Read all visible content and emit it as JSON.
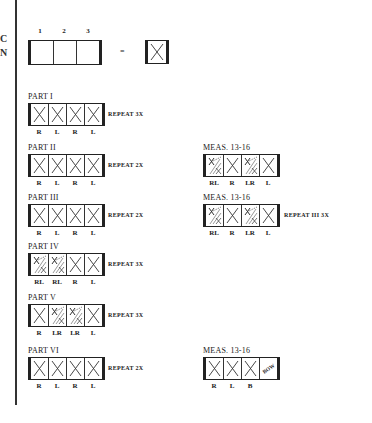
{
  "margin_letters": [
    "C",
    "N"
  ],
  "legend": {
    "numbers": [
      "1",
      "2",
      "3"
    ],
    "equals": "=",
    "cells": [
      "x",
      "",
      ""
    ],
    "single_cell": "x"
  },
  "parts": [
    {
      "label": "PART I",
      "cells": [
        "x",
        "x",
        "x",
        "x"
      ],
      "feet": [
        "R",
        "L",
        "R",
        "L"
      ],
      "repeat": "REPEAT 3X"
    },
    {
      "label": "PART II",
      "cells": [
        "x",
        "x",
        "x",
        "x"
      ],
      "feet": [
        "R",
        "L",
        "R",
        "L"
      ],
      "repeat": "REPEAT 2X"
    },
    {
      "label": "PART III",
      "cells": [
        "x",
        "x",
        "x",
        "x"
      ],
      "feet": [
        "R",
        "L",
        "R",
        "L"
      ],
      "repeat": "REPEAT 2X"
    },
    {
      "label": "PART IV",
      "cells": [
        "hatch",
        "hatch",
        "x",
        "x"
      ],
      "feet": [
        "RL",
        "RL",
        "R",
        "L"
      ],
      "repeat": "REPEAT 3X"
    },
    {
      "label": "PART V",
      "cells": [
        "x",
        "hatch",
        "hatch",
        "x"
      ],
      "feet": [
        "R",
        "LR",
        "LR",
        "L"
      ],
      "repeat": "REPEAT 3X"
    },
    {
      "label": "PART VI",
      "cells": [
        "x",
        "x",
        "x",
        "x"
      ],
      "feet": [
        "R",
        "L",
        "R",
        "L"
      ],
      "repeat": "REPEAT 2X"
    }
  ],
  "measures": [
    {
      "label": "MEAS. 13-16",
      "cells": [
        "hatch",
        "x",
        "hatch",
        "x"
      ],
      "feet": [
        "RL",
        "R",
        "LR",
        "L"
      ],
      "repeat": ""
    },
    {
      "label": "MEAS. 13-16",
      "cells": [
        "hatch",
        "x",
        "hatch",
        "x"
      ],
      "feet": [
        "RL",
        "R",
        "LR",
        "L"
      ],
      "repeat": "REPEAT III 3X"
    },
    {
      "label": "MEAS. 13-16",
      "cells": [
        "x",
        "x",
        "x",
        "bow"
      ],
      "feet": [
        "R",
        "L",
        "B",
        ""
      ],
      "bow_text": "BOW",
      "repeat": ""
    }
  ]
}
